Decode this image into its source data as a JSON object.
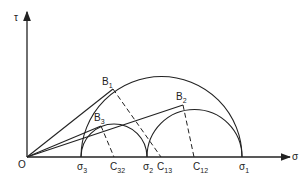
{
  "diagram": {
    "axes": {
      "x_label": "σ",
      "y_label": "τ",
      "origin_label": "O"
    },
    "points_on_axis": [
      {
        "id": "s3",
        "label": "σ",
        "sub": "3"
      },
      {
        "id": "c32",
        "label": "C",
        "sub": "32"
      },
      {
        "id": "s2",
        "label": "σ",
        "sub": "2"
      },
      {
        "id": "c13",
        "label": "C",
        "sub": "13"
      },
      {
        "id": "c12",
        "label": "C",
        "sub": "12"
      },
      {
        "id": "s1",
        "label": "σ",
        "sub": "1"
      }
    ],
    "tangent_points": [
      {
        "id": "b1",
        "label": "B",
        "sub": "1"
      },
      {
        "id": "b2",
        "label": "B",
        "sub": "2"
      },
      {
        "id": "b3",
        "label": "B",
        "sub": "3"
      }
    ],
    "stroke_color": "#222222"
  }
}
